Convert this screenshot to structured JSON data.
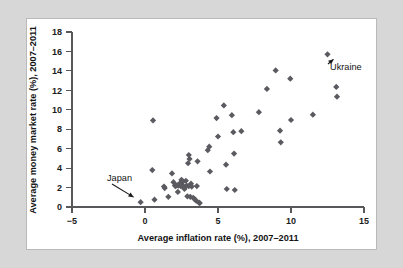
{
  "figure": {
    "background_color": "#d7d7d7",
    "card_color": "#ffffff",
    "border_color": "#b9b9b9"
  },
  "chart_data": {
    "type": "scatter",
    "title": "",
    "xlabel": "Average inflation rate (%), 2007–2011",
    "ylabel": "Average money market rate (%), 2007–2011",
    "xlim": [
      -5,
      15
    ],
    "ylim": [
      0,
      18
    ],
    "xticks": [
      -5,
      0,
      5,
      10,
      15
    ],
    "xtick_labels": [
      "−5",
      "0",
      "5",
      "10",
      "15"
    ],
    "yticks": [
      0,
      2,
      4,
      6,
      8,
      10,
      12,
      14,
      16,
      18
    ],
    "ytick_labels": [
      "0",
      "2",
      "4",
      "6",
      "8",
      "10",
      "12",
      "14",
      "16",
      "18"
    ],
    "grid": false,
    "legend": false,
    "marker_shape": "diamond",
    "marker_color": "#5a5a60",
    "marker_size": 3.1,
    "points": [
      {
        "x": -0.3,
        "y": 0.5
      },
      {
        "x": 0.55,
        "y": 8.9
      },
      {
        "x": 0.5,
        "y": 3.8
      },
      {
        "x": 0.65,
        "y": 0.75
      },
      {
        "x": 1.3,
        "y": 2.1
      },
      {
        "x": 1.35,
        "y": 1.95
      },
      {
        "x": 1.6,
        "y": 1.05
      },
      {
        "x": 1.85,
        "y": 3.45
      },
      {
        "x": 1.95,
        "y": 2.55
      },
      {
        "x": 2.05,
        "y": 2.2
      },
      {
        "x": 2.1,
        "y": 2.15
      },
      {
        "x": 2.2,
        "y": 2.25
      },
      {
        "x": 2.25,
        "y": 1.55
      },
      {
        "x": 2.3,
        "y": 2.2
      },
      {
        "x": 2.4,
        "y": 2.45
      },
      {
        "x": 2.45,
        "y": 2.15
      },
      {
        "x": 2.5,
        "y": 2.8
      },
      {
        "x": 2.55,
        "y": 2.15
      },
      {
        "x": 2.6,
        "y": 2.6
      },
      {
        "x": 2.65,
        "y": 2.1
      },
      {
        "x": 2.7,
        "y": 1.85
      },
      {
        "x": 2.75,
        "y": 2.05
      },
      {
        "x": 2.8,
        "y": 2.7
      },
      {
        "x": 2.85,
        "y": 2.2
      },
      {
        "x": 2.9,
        "y": 1.1
      },
      {
        "x": 2.95,
        "y": 4.5
      },
      {
        "x": 3.0,
        "y": 5.35
      },
      {
        "x": 3.0,
        "y": 2.15
      },
      {
        "x": 3.05,
        "y": 4.95
      },
      {
        "x": 3.1,
        "y": 1.05
      },
      {
        "x": 3.15,
        "y": 2.4
      },
      {
        "x": 3.2,
        "y": 2.1
      },
      {
        "x": 3.3,
        "y": 0.95
      },
      {
        "x": 3.4,
        "y": 0.8
      },
      {
        "x": 3.5,
        "y": 0.65
      },
      {
        "x": 3.55,
        "y": 2.15
      },
      {
        "x": 3.6,
        "y": 4.7
      },
      {
        "x": 3.7,
        "y": 0.45
      },
      {
        "x": 3.75,
        "y": 0.4
      },
      {
        "x": 4.3,
        "y": 5.85
      },
      {
        "x": 4.4,
        "y": 6.2
      },
      {
        "x": 4.45,
        "y": 3.65
      },
      {
        "x": 4.9,
        "y": 9.15
      },
      {
        "x": 5.0,
        "y": 7.25
      },
      {
        "x": 5.4,
        "y": 10.45
      },
      {
        "x": 5.55,
        "y": 4.35
      },
      {
        "x": 5.6,
        "y": 1.85
      },
      {
        "x": 5.95,
        "y": 9.45
      },
      {
        "x": 6.05,
        "y": 7.7
      },
      {
        "x": 6.1,
        "y": 5.5
      },
      {
        "x": 6.15,
        "y": 1.75
      },
      {
        "x": 6.6,
        "y": 7.8
      },
      {
        "x": 7.8,
        "y": 9.75
      },
      {
        "x": 8.35,
        "y": 12.15
      },
      {
        "x": 8.95,
        "y": 14.05
      },
      {
        "x": 9.25,
        "y": 7.85
      },
      {
        "x": 9.3,
        "y": 6.65
      },
      {
        "x": 9.95,
        "y": 13.2
      },
      {
        "x": 10.0,
        "y": 8.95
      },
      {
        "x": 11.5,
        "y": 9.5
      },
      {
        "x": 12.5,
        "y": 15.7
      },
      {
        "x": 13.1,
        "y": 12.35
      },
      {
        "x": 13.15,
        "y": 11.35
      }
    ],
    "annotations": [
      {
        "label": "Japan",
        "point_x": -0.3,
        "point_y": 0.5
      },
      {
        "label": "Ukraine",
        "point_x": 12.5,
        "point_y": 15.7
      }
    ]
  }
}
